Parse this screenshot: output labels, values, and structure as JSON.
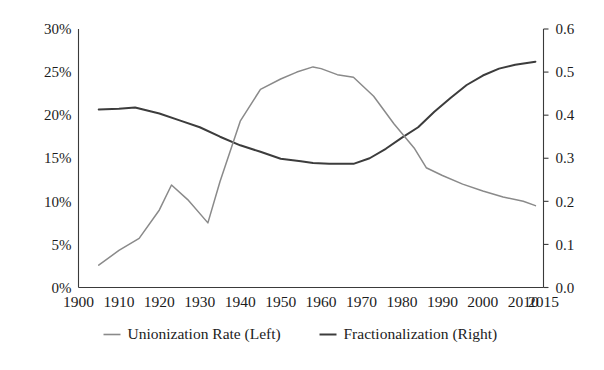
{
  "chart_data": {
    "type": "line",
    "title": "",
    "subtitle": "",
    "xlabel": "",
    "ylabel": "",
    "y2label": "",
    "xlim": [
      1900,
      2015
    ],
    "ylim": [
      0,
      30
    ],
    "y2lim": [
      0.0,
      0.6
    ],
    "grid": false,
    "legend_position": "bottom",
    "x_tick_labels": [
      "1900",
      "1910",
      "1920",
      "1930",
      "1940",
      "1950",
      "1960",
      "1970",
      "1980",
      "1990",
      "2000",
      "2010",
      "2015"
    ],
    "x_ticks": [
      1900,
      1910,
      1920,
      1930,
      1940,
      1950,
      1960,
      1970,
      1980,
      1990,
      2000,
      2010,
      2015
    ],
    "y_tick_labels": [
      "0%",
      "5%",
      "10%",
      "15%",
      "20%",
      "25%",
      "30%"
    ],
    "y_ticks": [
      0,
      5,
      10,
      15,
      20,
      25,
      30
    ],
    "y2_tick_labels": [
      "0.0",
      "0.1",
      "0.2",
      "0.3",
      "0.4",
      "0.5",
      "0.6"
    ],
    "y2_ticks": [
      0.0,
      0.1,
      0.2,
      0.3,
      0.4,
      0.5,
      0.6
    ],
    "series": [
      {
        "name": "Unionization Rate (Left)",
        "legend_label": "Unionization Rate (Left)",
        "axis": "left",
        "units": "percent",
        "color": "#8a8a8a",
        "x": [
          1905,
          1910,
          1915,
          1920,
          1923,
          1927,
          1932,
          1935,
          1940,
          1945,
          1950,
          1954,
          1958,
          1960,
          1964,
          1968,
          1973,
          1978,
          1983,
          1986,
          1990,
          1995,
          2000,
          2005,
          2010,
          2013
        ],
        "values": [
          2.6,
          4.3,
          5.7,
          9.0,
          11.9,
          10.2,
          7.5,
          12.3,
          19.3,
          23.0,
          24.2,
          25.0,
          25.6,
          25.4,
          24.7,
          24.4,
          22.2,
          19.0,
          16.2,
          13.9,
          13.0,
          12.0,
          11.2,
          10.5,
          10.0,
          9.5
        ]
      },
      {
        "name": "Fractionalization (Right)",
        "legend_label": "Fractionalization (Right)",
        "axis": "right",
        "units": "index",
        "color": "#3c3c3c",
        "x": [
          1905,
          1910,
          1914,
          1920,
          1925,
          1930,
          1935,
          1940,
          1945,
          1950,
          1955,
          1958,
          1962,
          1966,
          1968,
          1972,
          1976,
          1980,
          1984,
          1988,
          1992,
          1996,
          2000,
          2004,
          2008,
          2013
        ],
        "values": [
          0.413,
          0.415,
          0.418,
          0.404,
          0.388,
          0.372,
          0.35,
          0.33,
          0.315,
          0.299,
          0.293,
          0.289,
          0.287,
          0.287,
          0.287,
          0.3,
          0.322,
          0.348,
          0.372,
          0.408,
          0.44,
          0.47,
          0.492,
          0.508,
          0.517,
          0.524
        ]
      }
    ],
    "annotations": []
  },
  "legend": {
    "items": [
      {
        "label": "Unionization Rate (Left)",
        "color": "#8a8a8a"
      },
      {
        "label": "Fractionalization (Right)",
        "color": "#3c3c3c"
      }
    ]
  },
  "colors": {
    "unionization": "#8a8a8a",
    "fractionalization": "#3c3c3c",
    "axis": "#3a3a3a",
    "text": "#1c1c1c",
    "background": "#ffffff"
  }
}
